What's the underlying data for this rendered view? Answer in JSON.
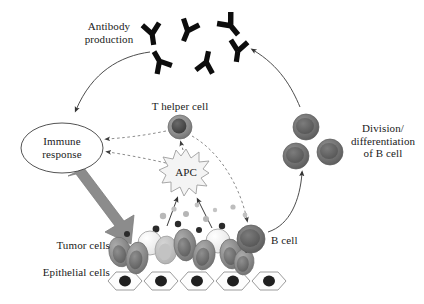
{
  "figure": {
    "background": "#ffffff",
    "width": 424,
    "height": 304
  },
  "labels": {
    "antibody_production": "Antibody\nproduction",
    "t_helper_cell": "T helper cell",
    "apc": "APC",
    "immune_response": "Immune\nresponse",
    "division_differentiation": "Division/\ndifferentiation\nof B cell",
    "b_cell": "B cell",
    "tumor_cells": "Tumor cells",
    "epithelial_cells": "Epithelial cells"
  },
  "colors": {
    "text": "#1a1a1a",
    "antibody": "#0d0d0d",
    "thick_arrow": "#808080",
    "thin_arrow": "#4d4d4d",
    "dashed_arrow": "#8c8c8c",
    "ellipse_stroke": "#404040",
    "apc_fill": "#f2f2f2",
    "apc_stroke": "#999999",
    "tcell_fill": "#8a8a8a",
    "tcell_nucleus": "#4a4a4a",
    "bcell_fill": "#6e6e6e",
    "bcell_nucleus": "#565656",
    "tumor_dark": "#7a7a7a",
    "tumor_light": "#efefef",
    "tumor_mid": "#bdbdbd",
    "epithelial_fill": "#fcfcfc",
    "epithelial_stroke": "#8f8f8f",
    "nucleus_black": "#1a1a1a",
    "antigen_gray": "#b5b5b5",
    "antigen_dark": "#2b2b2b"
  },
  "elements": {
    "antibodies": [
      {
        "id": "antibody-1",
        "cx": 152,
        "cy": 33,
        "rot": -8,
        "scale": 1.0
      },
      {
        "id": "antibody-2",
        "cx": 186,
        "cy": 29,
        "rot": 24,
        "scale": 1.0
      },
      {
        "id": "antibody-3",
        "cx": 228,
        "cy": 24,
        "rot": -38,
        "scale": 1.05
      },
      {
        "id": "antibody-4",
        "cx": 160,
        "cy": 62,
        "rot": 148,
        "scale": 1.0
      },
      {
        "id": "antibody-5",
        "cx": 205,
        "cy": 62,
        "rot": 190,
        "scale": 1.0
      },
      {
        "id": "antibody-6",
        "cx": 236,
        "cy": 52,
        "rot": 10,
        "scale": 1.0
      }
    ],
    "division_bcells": [
      {
        "id": "division-bcell-1",
        "cx": 306,
        "cy": 127,
        "r": 13
      },
      {
        "id": "division-bcell-2",
        "cx": 296,
        "cy": 155,
        "r": 13
      },
      {
        "id": "division-bcell-3",
        "cx": 329,
        "cy": 152,
        "r": 13
      }
    ],
    "t_helper_cell": {
      "cx": 180,
      "cy": 127,
      "r": 12
    },
    "b_cell": {
      "cx": 250,
      "cy": 240,
      "r": 14
    },
    "immune_ellipse": {
      "cx": 62,
      "cy": 148,
      "rx": 41,
      "ry": 25
    },
    "apc": {
      "cx": 186,
      "cy": 172,
      "r": 23,
      "points": 13
    },
    "epithelial_cells": [
      {
        "id": "epithelial-1",
        "cx": 124,
        "cy": 281
      },
      {
        "id": "epithelial-2",
        "cx": 160,
        "cy": 281
      },
      {
        "id": "epithelial-3",
        "cx": 196,
        "cy": 281
      },
      {
        "id": "epithelial-4",
        "cx": 232,
        "cy": 281
      },
      {
        "id": "epithelial-5",
        "cx": 268,
        "cy": 281
      }
    ],
    "tumor_cells": [
      {
        "id": "tumor-1",
        "cx": 120,
        "cy": 252,
        "rx": 11,
        "ry": 15,
        "rot": -12,
        "tone": "dark"
      },
      {
        "id": "tumor-2",
        "cx": 137,
        "cy": 258,
        "rx": 11,
        "ry": 16,
        "rot": 8,
        "tone": "dark"
      },
      {
        "id": "tumor-3",
        "cx": 150,
        "cy": 243,
        "rx": 12,
        "ry": 12,
        "rot": 0,
        "tone": "light"
      },
      {
        "id": "tumor-4",
        "cx": 166,
        "cy": 250,
        "rx": 11,
        "ry": 14,
        "rot": 5,
        "tone": "mid"
      },
      {
        "id": "tumor-5",
        "cx": 185,
        "cy": 245,
        "rx": 11,
        "ry": 16,
        "rot": -6,
        "tone": "dark"
      },
      {
        "id": "tumor-6",
        "cx": 204,
        "cy": 255,
        "rx": 11,
        "ry": 15,
        "rot": 10,
        "tone": "dark"
      },
      {
        "id": "tumor-7",
        "cx": 218,
        "cy": 241,
        "rx": 12,
        "ry": 12,
        "rot": 0,
        "tone": "light"
      },
      {
        "id": "tumor-8",
        "cx": 231,
        "cy": 254,
        "rx": 11,
        "ry": 15,
        "rot": -8,
        "tone": "dark"
      },
      {
        "id": "tumor-9",
        "cx": 243,
        "cy": 262,
        "rx": 10,
        "ry": 13,
        "rot": 6,
        "tone": "dark"
      }
    ],
    "antigen_particles": [
      {
        "cx": 163,
        "cy": 216,
        "r": 3.2,
        "tone": "gray"
      },
      {
        "cx": 174,
        "cy": 209,
        "r": 2.6,
        "tone": "gray"
      },
      {
        "cx": 186,
        "cy": 214,
        "r": 3.0,
        "tone": "gray"
      },
      {
        "cx": 197,
        "cy": 205,
        "r": 2.4,
        "tone": "gray"
      },
      {
        "cx": 205,
        "cy": 219,
        "r": 3.0,
        "tone": "gray"
      },
      {
        "cx": 214,
        "cy": 210,
        "r": 2.2,
        "tone": "gray"
      },
      {
        "cx": 232,
        "cy": 207,
        "r": 2.6,
        "tone": "gray"
      },
      {
        "cx": 244,
        "cy": 215,
        "r": 2.4,
        "tone": "gray"
      },
      {
        "cx": 156,
        "cy": 229,
        "r": 3.4,
        "tone": "dark"
      },
      {
        "cx": 178,
        "cy": 224,
        "r": 3.2,
        "tone": "dark"
      },
      {
        "cx": 199,
        "cy": 230,
        "r": 3.0,
        "tone": "dark"
      },
      {
        "cx": 222,
        "cy": 226,
        "r": 3.2,
        "tone": "dark"
      },
      {
        "cx": 240,
        "cy": 233,
        "r": 2.8,
        "tone": "dark"
      },
      {
        "cx": 127,
        "cy": 234,
        "r": 3.0,
        "tone": "dark"
      }
    ],
    "arrows": {
      "antibody_to_immune": {
        "style": "solid-thin",
        "label": "antibody to immune response"
      },
      "bcell_cluster_to_antibody": {
        "style": "solid-thin",
        "label": "dividing B cells to antibody production"
      },
      "bcell_to_cluster": {
        "style": "solid-thin",
        "label": "B cell to division cluster"
      },
      "tumor_to_apc_left": {
        "style": "solid-thin",
        "label": "antigen uptake left"
      },
      "tumor_to_apc_right": {
        "style": "solid-thin",
        "label": "antigen uptake right"
      },
      "apc_to_thelper": {
        "style": "dashed",
        "label": "APC to T helper cell"
      },
      "thelper_to_immune": {
        "style": "dashed",
        "label": "T helper cell to immune response"
      },
      "apc_to_immune": {
        "style": "dashed",
        "label": "APC to immune response"
      },
      "thelper_to_bcell": {
        "style": "dashed",
        "label": "T helper cell to B cell"
      },
      "immune_to_tumor": {
        "style": "thick-block",
        "label": "immune response attacks tumor"
      }
    }
  }
}
